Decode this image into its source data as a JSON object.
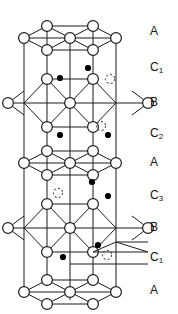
{
  "figure": {
    "kind": "crystal-structure-stacking-diagram",
    "colors": {
      "line": "#1a1a1a",
      "open_circle_fill": "#ffffff",
      "filled_dot": "#000000",
      "dashed_circle": "#555555",
      "background": "#ffffff",
      "text": "#111111"
    },
    "atom_legend": [
      {
        "name": "open-circle",
        "style": "open",
        "meaning": "large atom (lattice site)"
      },
      {
        "name": "filled-dot",
        "style": "solid",
        "meaning": "small interstitial atom"
      },
      {
        "name": "dashed-circle",
        "style": "dashed",
        "meaning": "vacant / partially occupied site"
      }
    ]
  },
  "labels": {
    "column_title": "layer-stacking-labels",
    "items": [
      {
        "id": "label-a-1",
        "text": "A",
        "base": "A",
        "sub": "",
        "y": 32
      },
      {
        "id": "label-c1-1",
        "text": "C1",
        "base": "C",
        "sub": "1",
        "y": 68
      },
      {
        "id": "label-b-1",
        "text": "B",
        "base": "B",
        "sub": "",
        "y": 103
      },
      {
        "id": "label-c2-1",
        "text": "C2",
        "base": "C",
        "sub": "2",
        "y": 134
      },
      {
        "id": "label-a-2",
        "text": "A",
        "base": "A",
        "sub": "",
        "y": 163
      },
      {
        "id": "label-c3-1",
        "text": "C3",
        "base": "C",
        "sub": "3",
        "y": 196
      },
      {
        "id": "label-b-2",
        "text": "B",
        "base": "B",
        "sub": "",
        "y": 228
      },
      {
        "id": "label-c1-2",
        "text": "C1",
        "base": "C",
        "sub": "1",
        "y": 258
      },
      {
        "id": "label-a-3",
        "text": "A",
        "base": "A",
        "sub": "",
        "y": 291
      }
    ],
    "stacking_sequence": [
      "A",
      "C1",
      "B",
      "C2",
      "A",
      "C3",
      "B",
      "C1",
      "A"
    ]
  },
  "geometry": {
    "cell": {
      "left": 24,
      "right": 116,
      "top": 26,
      "bottom": 292
    },
    "verticals": [
      24,
      47,
      70,
      93,
      116
    ],
    "layers": [
      {
        "id": "A-top",
        "label": "A",
        "y": 32,
        "type": "A"
      },
      {
        "id": "B-upper",
        "label": "B",
        "y": 103,
        "type": "B"
      },
      {
        "id": "A-mid",
        "label": "A",
        "y": 163,
        "type": "A"
      },
      {
        "id": "B-lower",
        "label": "B",
        "y": 228,
        "type": "B"
      },
      {
        "id": "A-bottom",
        "label": "A",
        "y": 291,
        "type": "A"
      }
    ],
    "interstitials": [
      {
        "id": "dot-1",
        "x": 88,
        "y": 68,
        "kind": "filled"
      },
      {
        "id": "dot-2",
        "x": 60,
        "y": 78,
        "kind": "filled"
      },
      {
        "id": "dot-3",
        "x": 60,
        "y": 135,
        "kind": "filled"
      },
      {
        "id": "dot-4",
        "x": 108,
        "y": 135,
        "kind": "filled"
      },
      {
        "id": "dot-5",
        "x": 92,
        "y": 182,
        "kind": "filled"
      },
      {
        "id": "dot-6",
        "x": 108,
        "y": 196,
        "kind": "filled"
      },
      {
        "id": "dot-7",
        "x": 98,
        "y": 245,
        "kind": "filled"
      },
      {
        "id": "dot-8",
        "x": 63,
        "y": 257,
        "kind": "filled"
      },
      {
        "id": "ring-1",
        "x": 110,
        "y": 79,
        "kind": "dashed"
      },
      {
        "id": "ring-2",
        "x": 92,
        "y": 125,
        "kind": "dashed"
      },
      {
        "id": "ring-3",
        "x": 58,
        "y": 193,
        "kind": "dashed"
      },
      {
        "id": "ring-4",
        "x": 107,
        "y": 255,
        "kind": "dashed"
      }
    ]
  }
}
